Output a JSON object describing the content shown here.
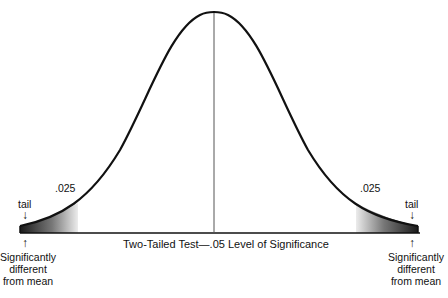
{
  "diagram": {
    "type": "normal-distribution-two-tailed",
    "caption": "Two-Tailed Test—.05 Level of Significance",
    "left_tail": {
      "area_label": ".025",
      "tail_label": "tail",
      "note_lines": [
        "Significantly",
        "different",
        "from mean"
      ]
    },
    "right_tail": {
      "area_label": ".025",
      "tail_label": "tail",
      "note_lines": [
        "Significantly",
        "different",
        "from mean"
      ]
    },
    "colors": {
      "curve": "#111111",
      "tail_dark": "#222222",
      "tail_light": "#e6e6e6",
      "axis": "#111111"
    }
  }
}
